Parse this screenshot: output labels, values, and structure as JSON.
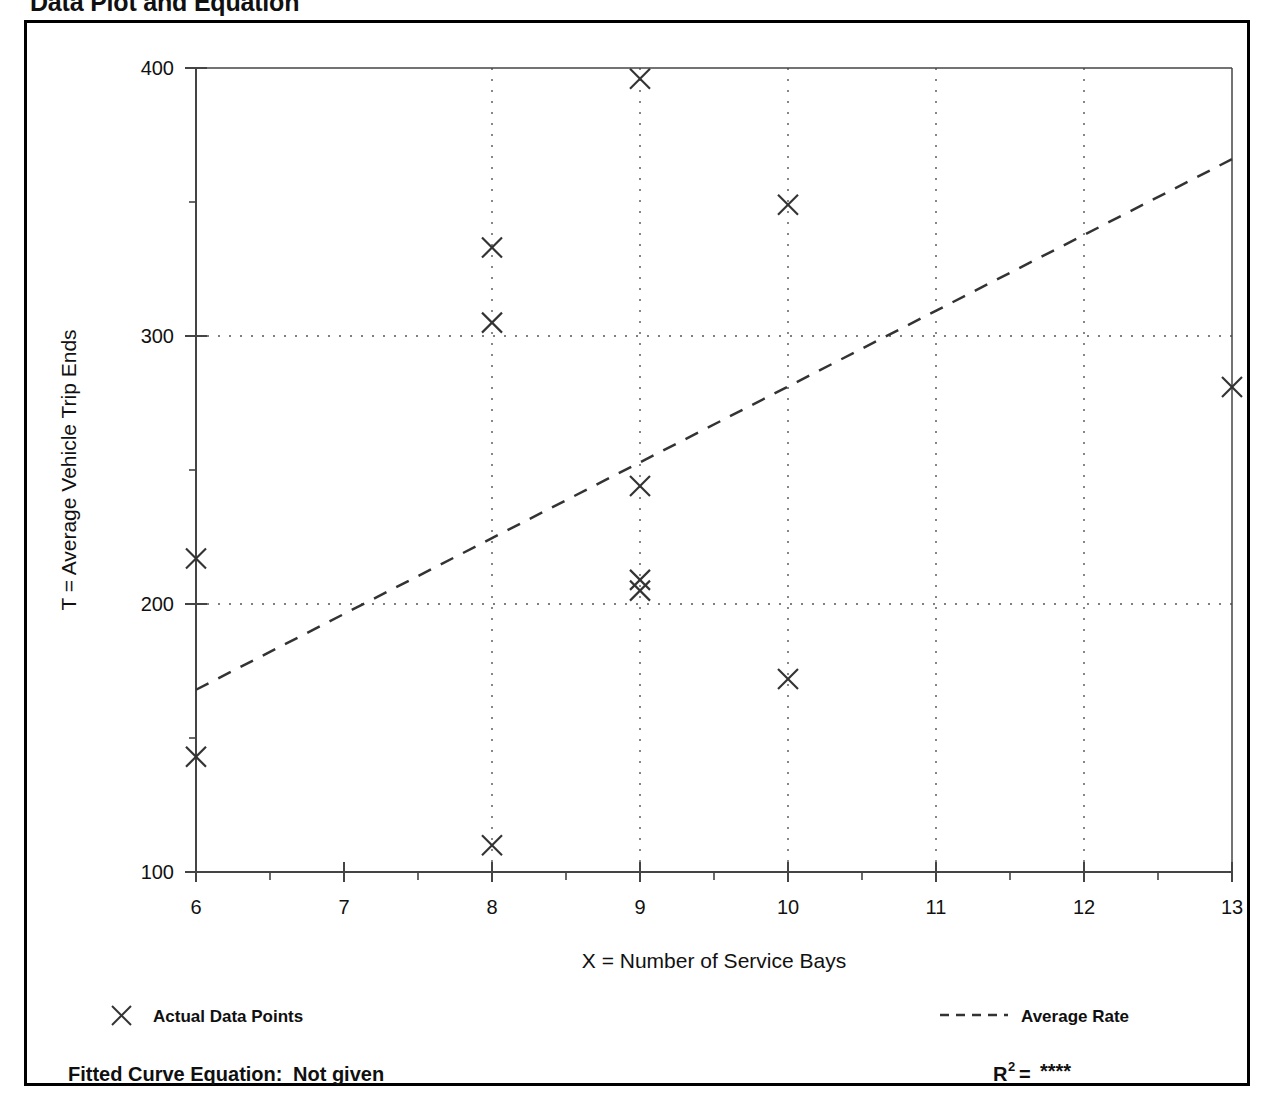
{
  "page": {
    "title": "Data Plot and Equation",
    "background": "#ffffff",
    "frame_color": "#000000"
  },
  "legend": {
    "points_marker": "x-marker-icon",
    "points_label": "Actual Data Points",
    "line_marker": "dashed-line-icon",
    "line_label": "Average Rate"
  },
  "footer": {
    "equation_label": "Fitted Curve Equation:",
    "equation_value": "Not given",
    "r2_label": "R",
    "r2_exponent": "2",
    "r2_equals": "=",
    "r2_value": "****"
  },
  "chart_data": {
    "type": "scatter",
    "title": "",
    "xlabel": "X = Number of Service Bays",
    "ylabel": "T = Average Vehicle Trip Ends",
    "xlim": [
      6,
      13
    ],
    "ylim": [
      100,
      400
    ],
    "xticks": [
      6,
      7,
      8,
      9,
      10,
      11,
      12,
      13
    ],
    "xtick_labels": [
      "6",
      "7",
      "8",
      "9",
      "10",
      "11",
      "12",
      "13"
    ],
    "yticks": [
      100,
      200,
      300,
      400
    ],
    "ytick_labels": [
      "100",
      "200",
      "300",
      "400"
    ],
    "y_minor_ticks": [
      150,
      250,
      350
    ],
    "grid": "dotted",
    "grid_x_values": [
      8,
      9,
      10,
      11,
      12
    ],
    "grid_y_values": [
      200,
      300
    ],
    "marker": "x",
    "marker_color": "#333333",
    "series": [
      {
        "name": "Actual Data Points",
        "points": [
          {
            "x": 6,
            "y": 217
          },
          {
            "x": 6,
            "y": 143
          },
          {
            "x": 8,
            "y": 333
          },
          {
            "x": 8,
            "y": 305
          },
          {
            "x": 8,
            "y": 110
          },
          {
            "x": 9,
            "y": 396
          },
          {
            "x": 9,
            "y": 244
          },
          {
            "x": 9,
            "y": 209
          },
          {
            "x": 9,
            "y": 205
          },
          {
            "x": 10,
            "y": 349
          },
          {
            "x": 10,
            "y": 172
          },
          {
            "x": 13,
            "y": 281
          }
        ]
      },
      {
        "name": "Average Rate",
        "type": "line",
        "style": "dashed",
        "color": "#333333",
        "endpoints": [
          {
            "x": 6,
            "y": 168
          },
          {
            "x": 13,
            "y": 366
          }
        ]
      }
    ]
  }
}
